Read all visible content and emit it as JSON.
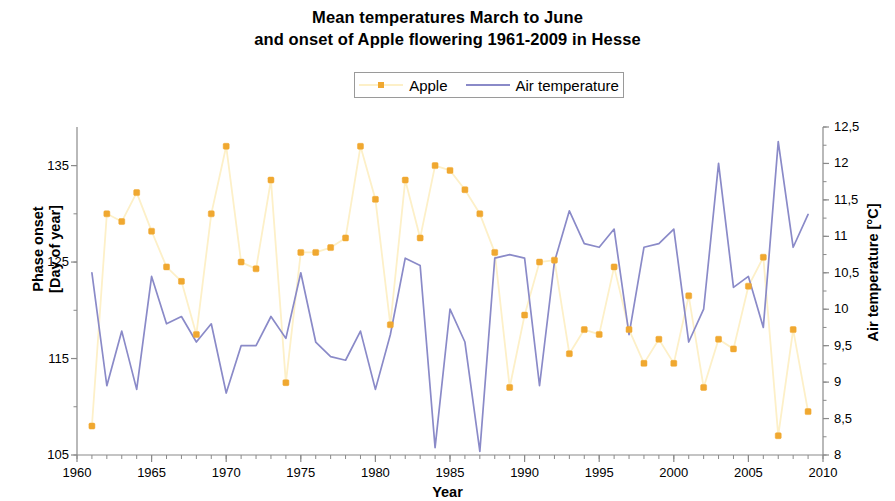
{
  "title": {
    "line1": "Mean temperatures March to June",
    "line2": "and onset of Apple flowering 1961-2009 in Hesse"
  },
  "legend": {
    "position": "top-center",
    "items": [
      {
        "label": "Apple",
        "color": "#f0a830",
        "line_color": "#fdf0c8",
        "marker": "square"
      },
      {
        "label": "Air temperature",
        "color": "#8a8ac8",
        "line_color": "#8a8ac8",
        "marker": "none"
      }
    ]
  },
  "axes": {
    "x": {
      "label": "Year",
      "min": 1960,
      "max": 2010,
      "ticks": [
        1960,
        1965,
        1970,
        1975,
        1980,
        1985,
        1990,
        1995,
        2000,
        2005,
        2010
      ],
      "minor_tick_step": 1
    },
    "y_left": {
      "label_line1": "Phase onset",
      "label_line2": "[Day of year]",
      "min": 105,
      "max": 139,
      "ticks": [
        105,
        115,
        125,
        135
      ],
      "minor_tick_step": 5
    },
    "y_right": {
      "label": "Air temperature [°C]",
      "min": 8,
      "max": 12.5,
      "ticks": [
        "8",
        "8,5",
        "9",
        "9,5",
        "10",
        "10,5",
        "11",
        "11,5",
        "12",
        "12,5"
      ],
      "tick_values": [
        8,
        8.5,
        9,
        9.5,
        10,
        10.5,
        11,
        11.5,
        12,
        12.5
      ],
      "minor_tick_step": 0.25
    }
  },
  "chart_data": {
    "type": "line",
    "title": "Mean temperatures March to June and onset of Apple flowering 1961-2009 in Hesse",
    "xlabel": "Year",
    "ylabel": "Phase onset [Day of year]",
    "ylabel2": "Air temperature [°C]",
    "xlim": [
      1960,
      2010
    ],
    "ylim": [
      105,
      139
    ],
    "ylim2": [
      8,
      12.5
    ],
    "grid": false,
    "legend_position": "top-center",
    "x": [
      1961,
      1962,
      1963,
      1964,
      1965,
      1966,
      1967,
      1968,
      1969,
      1970,
      1971,
      1972,
      1973,
      1974,
      1975,
      1976,
      1977,
      1978,
      1979,
      1980,
      1981,
      1982,
      1983,
      1984,
      1985,
      1986,
      1987,
      1988,
      1989,
      1990,
      1991,
      1992,
      1993,
      1994,
      1995,
      1996,
      1997,
      1998,
      1999,
      2000,
      2001,
      2002,
      2003,
      2004,
      2005,
      2006,
      2007,
      2008,
      2009
    ],
    "series": [
      {
        "name": "Apple",
        "axis": "left",
        "units": "Day of year",
        "color": "#f0a830",
        "line_color": "#fdf0c8",
        "marker": "square",
        "values": [
          108.0,
          130.0,
          129.2,
          132.2,
          128.2,
          124.5,
          123.0,
          117.5,
          130.0,
          137.0,
          125.0,
          124.3,
          133.5,
          112.5,
          126.0,
          126.0,
          126.5,
          127.5,
          137.0,
          131.5,
          118.5,
          133.5,
          127.5,
          135.0,
          134.5,
          132.5,
          130.0,
          126.0,
          112.0,
          119.5,
          125.0,
          125.2,
          115.5,
          118.0,
          117.5,
          124.5,
          118.0,
          114.5,
          117.0,
          114.5,
          121.5,
          112.0,
          117.0,
          116.0,
          122.5,
          125.5,
          107.0,
          118.0,
          109.5
        ]
      },
      {
        "name": "Air temperature",
        "axis": "right",
        "units": "°C",
        "color": "#8a8ac8",
        "values": [
          10.5,
          8.95,
          9.7,
          8.9,
          10.45,
          9.8,
          9.9,
          9.55,
          9.8,
          8.85,
          9.5,
          9.5,
          9.9,
          9.6,
          10.5,
          9.55,
          9.35,
          9.3,
          9.7,
          8.9,
          9.65,
          10.7,
          10.6,
          8.1,
          10.0,
          9.55,
          8.05,
          10.7,
          10.75,
          10.7,
          8.95,
          10.65,
          11.35,
          10.9,
          10.85,
          11.1,
          9.65,
          10.85,
          10.9,
          11.1,
          9.55,
          10.0,
          12.0,
          10.3,
          10.45,
          9.75,
          12.3,
          10.85,
          11.3
        ]
      }
    ]
  }
}
